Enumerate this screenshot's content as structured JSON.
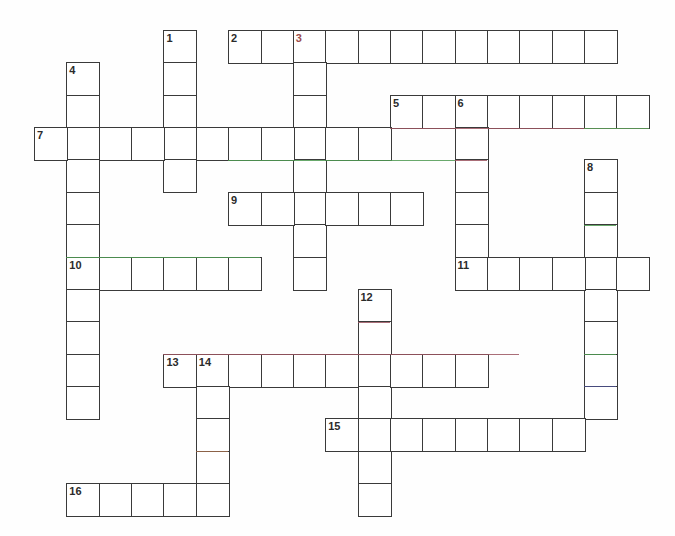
{
  "puzzle": {
    "type": "crossword-grid",
    "title": "Crossword Puzzle Grid",
    "grid": {
      "origin_x": 34,
      "origin_y": 30,
      "cell_size": 32.35,
      "columns": 20,
      "rows": 16,
      "cell_fill": "#ffffff",
      "cell_border": "#3a3a3a",
      "page_background": "#fefefe"
    },
    "entries": [
      {
        "number": "1",
        "direction": "down",
        "row": 0,
        "col": 4,
        "length": 5
      },
      {
        "number": "2",
        "direction": "across",
        "row": 0,
        "col": 6,
        "length": 12
      },
      {
        "number": "3",
        "direction": "down",
        "row": 0,
        "col": 8,
        "length": 8
      },
      {
        "number": "4",
        "direction": "down",
        "row": 1,
        "col": 1,
        "length": 11
      },
      {
        "number": "5",
        "direction": "across",
        "row": 2,
        "col": 11,
        "length": 8
      },
      {
        "number": "6",
        "direction": "down",
        "row": 2,
        "col": 13,
        "length": 6
      },
      {
        "number": "7",
        "direction": "across",
        "row": 3,
        "col": 0,
        "length": 11
      },
      {
        "number": "8",
        "direction": "down",
        "row": 4,
        "col": 17,
        "length": 8
      },
      {
        "number": "9",
        "direction": "across",
        "row": 5,
        "col": 6,
        "length": 6
      },
      {
        "number": "10",
        "direction": "across",
        "row": 7,
        "col": 1,
        "length": 6
      },
      {
        "number": "11",
        "direction": "across",
        "row": 7,
        "col": 13,
        "length": 6
      },
      {
        "number": "12",
        "direction": "down",
        "row": 8,
        "col": 10,
        "length": 7
      },
      {
        "number": "13",
        "direction": "across",
        "row": 10,
        "col": 4,
        "length": 10
      },
      {
        "number": "14",
        "direction": "down",
        "row": 10,
        "col": 5,
        "length": 5
      },
      {
        "number": "15",
        "direction": "across",
        "row": 12,
        "col": 9,
        "length": 8
      },
      {
        "number": "16",
        "direction": "across",
        "row": 14,
        "col": 1,
        "length": 5
      }
    ],
    "numbered_cells": [
      {
        "label": "1",
        "row": 0,
        "col": 4,
        "tint": "dark"
      },
      {
        "label": "2",
        "row": 0,
        "col": 6,
        "tint": "dark"
      },
      {
        "label": "3",
        "row": 0,
        "col": 8,
        "tint": "red"
      },
      {
        "label": "4",
        "row": 1,
        "col": 1,
        "tint": "dark"
      },
      {
        "label": "5",
        "row": 2,
        "col": 11,
        "tint": "dark"
      },
      {
        "label": "6",
        "row": 2,
        "col": 13,
        "tint": "dark"
      },
      {
        "label": "7",
        "row": 3,
        "col": 0,
        "tint": "dark"
      },
      {
        "label": "8",
        "row": 4,
        "col": 17,
        "tint": "dark"
      },
      {
        "label": "9",
        "row": 5,
        "col": 6,
        "tint": "dark"
      },
      {
        "label": "10",
        "row": 7,
        "col": 1,
        "tint": "dark"
      },
      {
        "label": "11",
        "row": 7,
        "col": 13,
        "tint": "dark"
      },
      {
        "label": "12",
        "row": 8,
        "col": 10,
        "tint": "dark"
      },
      {
        "label": "13",
        "row": 10,
        "col": 4,
        "tint": "dark"
      },
      {
        "label": "14",
        "row": 10,
        "col": 5,
        "tint": "dark"
      },
      {
        "label": "15",
        "row": 12,
        "col": 9,
        "tint": "dark"
      },
      {
        "label": "16",
        "row": 14,
        "col": 1,
        "tint": "dark"
      }
    ],
    "scan_tints": [
      {
        "row": 4,
        "col_start": 6,
        "col_end": 11,
        "color": "#4f9a52"
      },
      {
        "row": 3,
        "col_start": 11,
        "col_end": 19,
        "color": "#9b5560"
      },
      {
        "row": 3,
        "col_start": 17,
        "col_end": 19,
        "color": "#4f9a52"
      },
      {
        "row": 4,
        "col_start": 11,
        "col_end": 13,
        "color": "#4f9a52"
      },
      {
        "row": 7,
        "col_start": 1,
        "col_end": 7,
        "color": "#4f9a52"
      },
      {
        "row": 6,
        "col_start": 17,
        "col_end": 18,
        "color": "#4f9a52"
      },
      {
        "row": 10,
        "col_start": 4,
        "col_end": 15,
        "color": "#9b5560"
      },
      {
        "row": 10,
        "col_start": 17,
        "col_end": 18,
        "color": "#4f9a52"
      },
      {
        "row": 11,
        "col_start": 17,
        "col_end": 18,
        "color": "#4a4f8a"
      },
      {
        "row": 4,
        "col_start": 13,
        "col_end": 14,
        "color": "#9b5560"
      },
      {
        "row": 9,
        "col_start": 10,
        "col_end": 11,
        "color": "#9b5560"
      },
      {
        "row": 13,
        "col_start": 5,
        "col_end": 6,
        "color": "#9b6a4b"
      }
    ]
  }
}
